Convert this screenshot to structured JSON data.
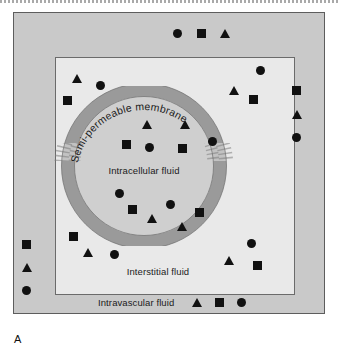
{
  "figure": {
    "panel_letter": "A",
    "labels": {
      "membrane": "Semi-permeable membrane",
      "intracellular": "Intracellular  fluid",
      "interstitial": "Interstitial fluid",
      "intravascular": "Intravascular fluid"
    },
    "colors": {
      "intravascular_bg": "#c9c9c9",
      "interstitial_bg": "#e9e9e9",
      "intracellular_bg": "#cfcfcf",
      "membrane": "#9a9a9a",
      "membrane_gap": "#c2c2c2",
      "marker": "#111111",
      "border": "#5d5d5d"
    },
    "legend_markers": [
      "triangle",
      "square",
      "circle"
    ]
  },
  "markers": {
    "intravascular": [
      {
        "shape": "circle",
        "x": 173,
        "y": 29
      },
      {
        "shape": "square",
        "x": 197,
        "y": 29
      },
      {
        "shape": "triangle",
        "x": 220,
        "y": 29
      },
      {
        "shape": "square",
        "x": 292,
        "y": 86
      },
      {
        "shape": "triangle",
        "x": 292,
        "y": 110
      },
      {
        "shape": "circle",
        "x": 292,
        "y": 133
      },
      {
        "shape": "square",
        "x": 22,
        "y": 240
      },
      {
        "shape": "triangle",
        "x": 22,
        "y": 263
      },
      {
        "shape": "circle",
        "x": 22,
        "y": 286
      }
    ],
    "interstitial": [
      {
        "shape": "triangle",
        "x": 72,
        "y": 74
      },
      {
        "shape": "circle",
        "x": 96,
        "y": 81
      },
      {
        "shape": "square",
        "x": 63,
        "y": 96
      },
      {
        "shape": "circle",
        "x": 256,
        "y": 66
      },
      {
        "shape": "triangle",
        "x": 229,
        "y": 86
      },
      {
        "shape": "square",
        "x": 249,
        "y": 95
      },
      {
        "shape": "square",
        "x": 69,
        "y": 232
      },
      {
        "shape": "triangle",
        "x": 83,
        "y": 248
      },
      {
        "shape": "circle",
        "x": 110,
        "y": 250
      },
      {
        "shape": "circle",
        "x": 247,
        "y": 239
      },
      {
        "shape": "triangle",
        "x": 224,
        "y": 256
      },
      {
        "shape": "square",
        "x": 253,
        "y": 261
      }
    ],
    "intracellular": [
      {
        "shape": "triangle",
        "x": 142,
        "y": 120
      },
      {
        "shape": "triangle",
        "x": 180,
        "y": 120
      },
      {
        "shape": "square",
        "x": 122,
        "y": 140
      },
      {
        "shape": "circle",
        "x": 145,
        "y": 143
      },
      {
        "shape": "square",
        "x": 178,
        "y": 144
      },
      {
        "shape": "circle",
        "x": 208,
        "y": 137
      },
      {
        "shape": "circle",
        "x": 115,
        "y": 189
      },
      {
        "shape": "square",
        "x": 128,
        "y": 205
      },
      {
        "shape": "circle",
        "x": 166,
        "y": 200
      },
      {
        "shape": "triangle",
        "x": 147,
        "y": 214
      },
      {
        "shape": "square",
        "x": 195,
        "y": 208
      },
      {
        "shape": "triangle",
        "x": 177,
        "y": 222
      }
    ]
  }
}
